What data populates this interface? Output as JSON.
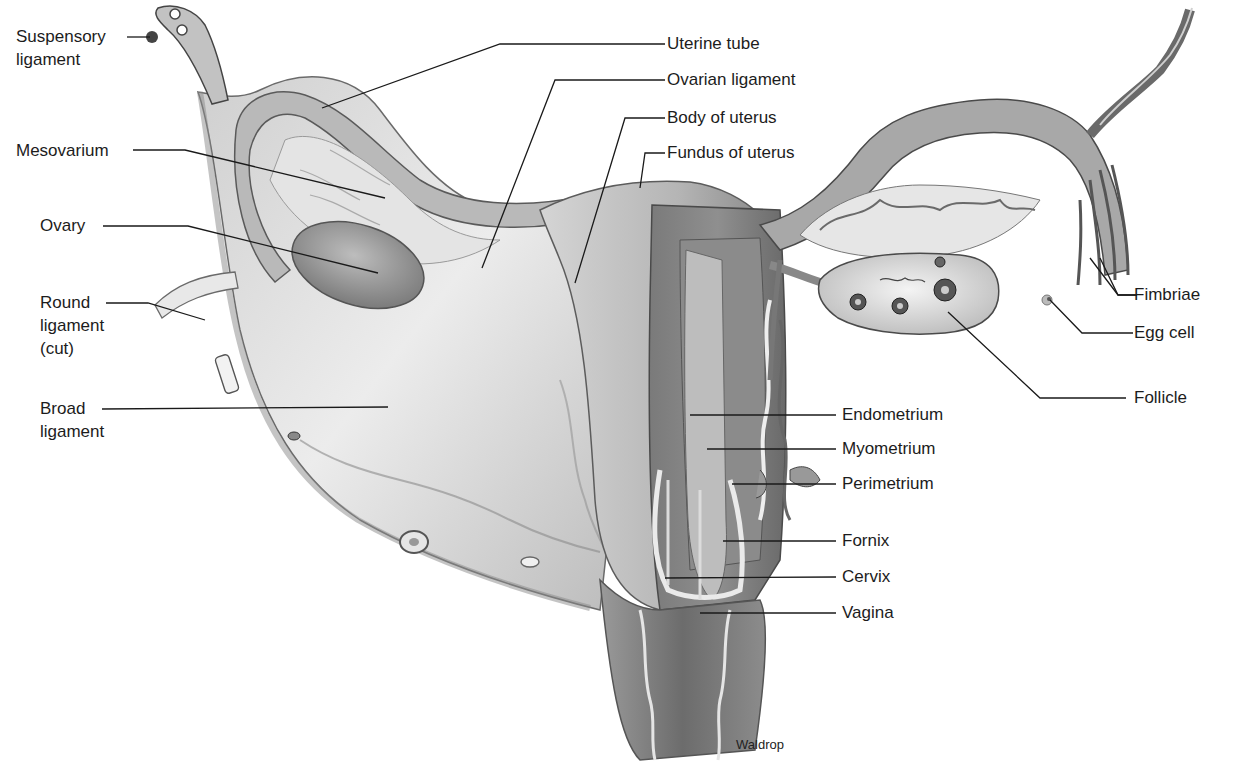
{
  "diagram": {
    "credit": "Waldrop",
    "labels_left": [
      {
        "id": "suspensory-ligament",
        "text": "Suspensory ligament"
      },
      {
        "id": "mesovarium",
        "text": "Mesovarium"
      },
      {
        "id": "ovary",
        "text": "Ovary"
      },
      {
        "id": "round-ligament",
        "text": "Round ligament (cut)"
      },
      {
        "id": "broad-ligament",
        "text": "Broad ligament"
      }
    ],
    "labels_top": [
      {
        "id": "uterine-tube",
        "text": "Uterine tube"
      },
      {
        "id": "ovarian-ligament",
        "text": "Ovarian ligament"
      },
      {
        "id": "body-of-uterus",
        "text": "Body of uterus"
      },
      {
        "id": "fundus-of-uterus",
        "text": "Fundus of uterus"
      }
    ],
    "labels_right": [
      {
        "id": "fimbriae",
        "text": "Fimbriae"
      },
      {
        "id": "egg-cell",
        "text": "Egg cell"
      },
      {
        "id": "follicle",
        "text": "Follicle"
      }
    ],
    "labels_center_right": [
      {
        "id": "endometrium",
        "text": "Endometrium"
      },
      {
        "id": "myometrium",
        "text": "Myometrium"
      },
      {
        "id": "perimetrium",
        "text": "Perimetrium"
      },
      {
        "id": "fornix",
        "text": "Fornix"
      },
      {
        "id": "cervix",
        "text": "Cervix"
      },
      {
        "id": "vagina",
        "text": "Vagina"
      }
    ],
    "colors": {
      "background": "#ffffff",
      "tissue_light": "#d9d9d9",
      "tissue_mid": "#a9a9a9",
      "tissue_dark": "#6e6e6e",
      "leader_line": "#1a1a1a"
    }
  }
}
